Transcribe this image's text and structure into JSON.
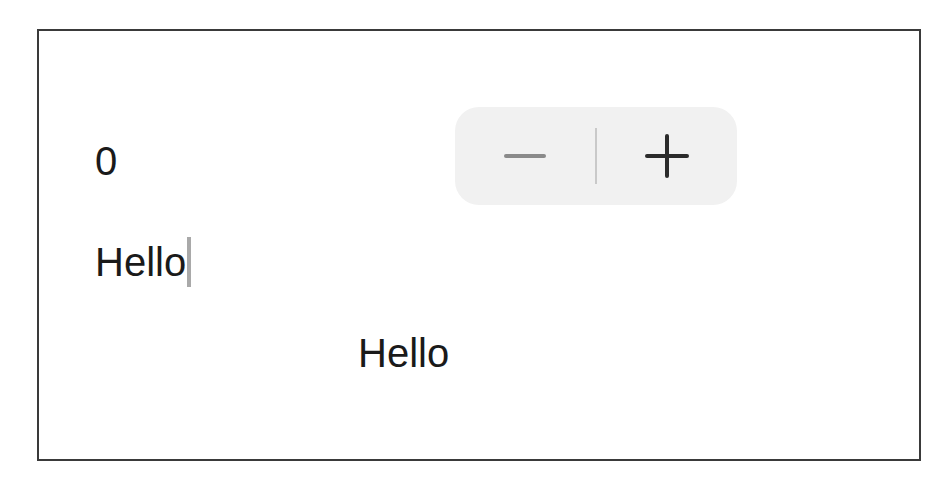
{
  "counter": {
    "value": "0"
  },
  "stepper": {
    "decrement_icon": "minus-icon",
    "increment_icon": "plus-icon",
    "decrement_enabled": false,
    "increment_enabled": true
  },
  "text_field": {
    "value": "Hello",
    "focused": true
  },
  "mirror_label": {
    "text": "Hello"
  },
  "colors": {
    "border": "#3a3a3a",
    "stepper_background": "#f1f1f1",
    "disabled_glyph": "#8a8a8a",
    "enabled_glyph": "#2b2b2b",
    "caret": "#a9a9a9"
  }
}
